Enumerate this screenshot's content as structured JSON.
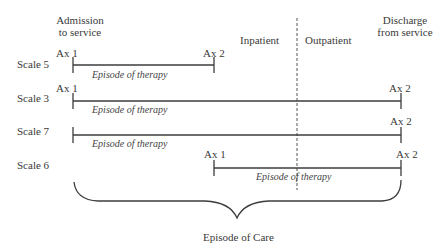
{
  "header": {
    "admission": [
      "Admission",
      "to service"
    ],
    "discharge": [
      "Discharge",
      "from service"
    ],
    "inpatient": "Inpatient",
    "outpatient": "Outpatient"
  },
  "rows": [
    {
      "scale": "Scale 5",
      "start_label": "Ax 1",
      "end_label": "Ax 2",
      "episode": "Episode of therapy"
    },
    {
      "scale": "Scale 3",
      "start_label": "Ax 1",
      "end_label": "Ax 2",
      "episode": "Episode of therapy"
    },
    {
      "scale": "Scale 7",
      "start_label": "",
      "end_label": "Ax 2",
      "episode": "Episode of therapy"
    },
    {
      "scale": "Scale 6",
      "start_label": "Ax 1",
      "end_label": "Ax 2",
      "episode": "Episode of therapy"
    }
  ],
  "brace_label": "Episode of Care",
  "colors": {
    "line": "#3c3c3c",
    "text": "#3a3a3a"
  }
}
